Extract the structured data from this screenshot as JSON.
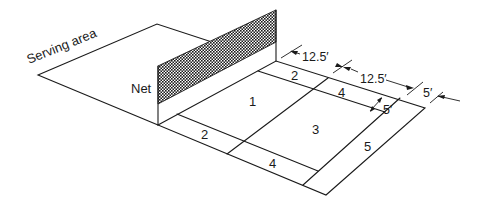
{
  "diagram": {
    "labels": {
      "serving_area": "Serving area",
      "net": "Net"
    },
    "zones": [
      {
        "id": "zone-1",
        "label": "1"
      },
      {
        "id": "zone-2-far",
        "label": "2"
      },
      {
        "id": "zone-4-far",
        "label": "4"
      },
      {
        "id": "zone-3",
        "label": "3"
      },
      {
        "id": "zone-5",
        "label": "5"
      },
      {
        "id": "zone-2-near",
        "label": "2"
      },
      {
        "id": "zone-4-near",
        "label": "4"
      }
    ],
    "dimensions": {
      "first_half": "12.5′",
      "second_half": "12.5′",
      "outer_strip": "5′",
      "inner_strip": "5′"
    },
    "colors": {
      "line": "#1a1a1a",
      "background": "#ffffff"
    }
  }
}
